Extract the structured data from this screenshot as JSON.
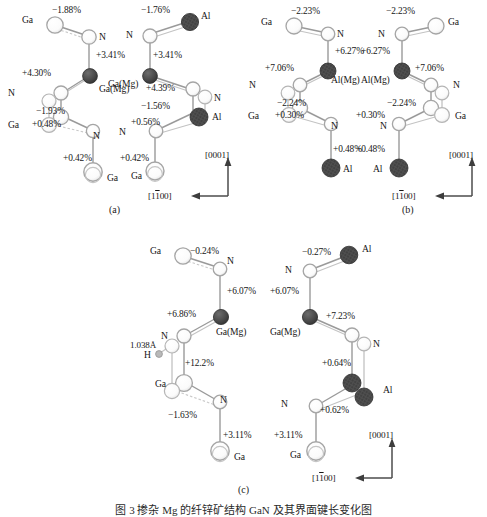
{
  "figure": {
    "caption": "图 3  掺杂 Mg 的纤锌矿结构 GaN 及其界面键长变化图",
    "panel_labels": [
      "(a)",
      "(b)",
      "(c)"
    ],
    "axis": {
      "vertical_label": "[0001]",
      "horizontal_label": "[1Ā1̅00]",
      "horizontal_label_display": "[1100]",
      "overbar_digit": "1"
    },
    "atom_types": {
      "open": "Ga/N open circle",
      "filled": "Mg/Al filled hatched circle",
      "hydrogen": "H small gray circle"
    }
  },
  "panels": [
    {
      "id": "a",
      "label": "(a)",
      "structures": [
        {
          "side": "left",
          "atom_labels": [
            "Ga",
            "N",
            "Ga(Mg)",
            "N",
            "Ga",
            "N",
            "Ga"
          ],
          "percentages": [
            "−1.88%",
            "+3.41%",
            "+4.30%",
            "−1.93%",
            "+0.48%",
            "+0.42%"
          ]
        },
        {
          "side": "right",
          "atom_labels": [
            "Al",
            "N",
            "Ga(Mg)",
            "N",
            "Al",
            "N",
            "Ga"
          ],
          "percentages": [
            "−1.76%",
            "+3.41%",
            "+4.39%",
            "−1.56%",
            "+0.56%",
            "+0.42%"
          ]
        }
      ],
      "has_axis": true
    },
    {
      "id": "b",
      "label": "(b)",
      "structures": [
        {
          "side": "left",
          "atom_labels": [
            "Ga",
            "N",
            "Al(Mg)",
            "N",
            "Ga",
            "N",
            "Al"
          ],
          "percentages": [
            "−2.23%",
            "+6.27%",
            "+7.06%",
            "−2.24%",
            "+0.30%",
            "+0.48%"
          ]
        },
        {
          "side": "right",
          "atom_labels": [
            "Ga",
            "N",
            "Al(Mg)",
            "N",
            "Ga",
            "N",
            "Al"
          ],
          "percentages": [
            "−2.23%",
            "+6.27%",
            "+7.06%",
            "−2.24%",
            "+0.30%",
            "+0.48%"
          ]
        }
      ],
      "has_axis": true
    },
    {
      "id": "c",
      "label": "(c)",
      "structures": [
        {
          "side": "left",
          "atom_labels": [
            "Ga",
            "N",
            "Ga(Mg)",
            "N",
            "H",
            "Ga",
            "N",
            "Ga"
          ],
          "percentages": [
            "−0.24%",
            "+6.07%",
            "+6.86%",
            "+12.2%",
            "−1.63%",
            "+3.11%"
          ],
          "bond_length": "1.038Å"
        },
        {
          "side": "right",
          "atom_labels": [
            "Al",
            "N",
            "Ga(Mg)",
            "N",
            "Al",
            "N",
            "Ga"
          ],
          "percentages": [
            "−0.27%",
            "+6.07%",
            "+7.23%",
            "+0.64%",
            "+0.62%",
            "+3.11%"
          ]
        }
      ],
      "has_axis": true
    }
  ],
  "colors": {
    "bond": "#8f8f8f",
    "open_atom_fill": "#ffffff",
    "open_atom_stroke": "#a8a8a8",
    "filled_atom": "#4a4a4a",
    "text": "#161616",
    "axis": "#4d4d4d"
  }
}
